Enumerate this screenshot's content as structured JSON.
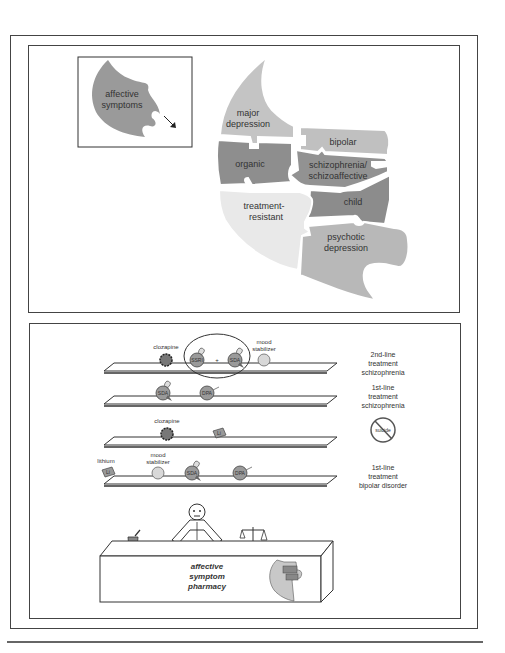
{
  "top_panel": {
    "inset": {
      "label_line1": "affective",
      "label_line2": "symptoms",
      "arrow": "arrow-down-right-icon"
    },
    "puzzle_pieces": [
      {
        "id": "major-depression",
        "lines": [
          "major",
          "depression"
        ],
        "color": "#c4c4c4"
      },
      {
        "id": "bipolar",
        "lines": [
          "bipolar"
        ],
        "color": "#c0c0c0"
      },
      {
        "id": "organic",
        "lines": [
          "organic"
        ],
        "color": "#8e8e8e"
      },
      {
        "id": "schizophrenia",
        "lines": [
          "schizophrenia/",
          "schizoaffective"
        ],
        "color": "#929292"
      },
      {
        "id": "child",
        "lines": [
          "child"
        ],
        "color": "#8c8c8c"
      },
      {
        "id": "treatment-resistant",
        "lines": [
          "treatment-",
          "resistant"
        ],
        "color": "#e9e9e9"
      },
      {
        "id": "psychotic-depression",
        "lines": [
          "psychotic",
          "depression"
        ],
        "color": "#b8b8b8"
      }
    ]
  },
  "bottom_panel": {
    "shelves": [
      {
        "label": [
          "2nd-line",
          "treatment",
          "schizophrenia"
        ],
        "items": [
          {
            "type": "clozapine",
            "label": "clozapine"
          },
          {
            "type": "ssri",
            "label": "SSRI"
          },
          {
            "type": "plus",
            "label": "+"
          },
          {
            "type": "sda",
            "label": "SDA"
          },
          {
            "type": "mood",
            "label_lines": [
              "mood",
              "stabilizer"
            ]
          }
        ]
      },
      {
        "label": [
          "1st-line",
          "treatment",
          "schizophrenia"
        ],
        "items": [
          {
            "type": "sda",
            "label": "SDA"
          },
          {
            "type": "dpa",
            "label": "DPA"
          }
        ]
      },
      {
        "label": [
          "suicide"
        ],
        "items": [
          {
            "type": "clozapine",
            "label": "clozapine"
          },
          {
            "type": "lithium",
            "label": "Li"
          }
        ]
      },
      {
        "label": [
          "1st-line",
          "treatment",
          "bipolar disorder"
        ],
        "items": [
          {
            "type": "lithium",
            "label": "Li",
            "caption": "lithium"
          },
          {
            "type": "mood",
            "label_lines": [
              "mood",
              "stabilizer"
            ]
          },
          {
            "type": "sda",
            "label": "SDA"
          },
          {
            "type": "dpa",
            "label": "DPA"
          }
        ]
      }
    ],
    "no_suicide_icon_text": "suicide",
    "counter_text": [
      "affective",
      "symptom",
      "pharmacy"
    ]
  },
  "colors": {
    "line": "#333333",
    "pill_fill": "#9a9a9a",
    "mood_fill": "#d8d8d8"
  }
}
